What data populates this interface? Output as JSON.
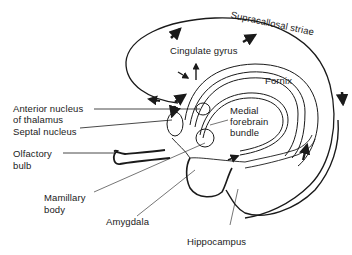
{
  "diagram": {
    "type": "anatomical-diagram",
    "labels": {
      "supracallosal_striae": "Supracallosal striae",
      "cingulate_gyrus": "Cingulate gyrus",
      "fornix": "Fornix",
      "anterior_nucleus_line1": "Anterior nucleus",
      "anterior_nucleus_line2": "of thalamus",
      "septal_nucleus": "Septal nucleus",
      "medial_forebrain_line1": "Medial",
      "medial_forebrain_line2": "forebrain",
      "medial_forebrain_line3": "bundle",
      "olfactory_bulb_line1": "Olfactory",
      "olfactory_bulb_line2": "bulb",
      "mamillary_body_line1": "Mamillary",
      "mamillary_body_line2": "body",
      "amygdala": "Amygdala",
      "hippocampus": "Hippocampus"
    },
    "colors": {
      "ink": "#1a1a1a",
      "background": "#ffffff"
    }
  }
}
